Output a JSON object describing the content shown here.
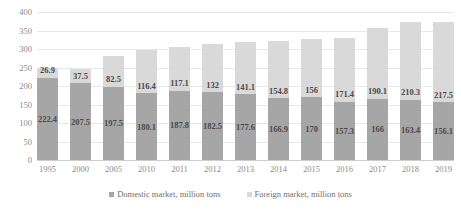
{
  "chart_data": {
    "type": "bar",
    "subtype": "stacked-column",
    "title": "",
    "xlabel": "",
    "ylabel": "",
    "ylim": [
      0,
      400
    ],
    "yticks": [
      0,
      50,
      100,
      150,
      200,
      250,
      300,
      350,
      400
    ],
    "grid": true,
    "legend_position": "bottom",
    "categories": [
      "1995",
      "2000",
      "2005",
      "2010",
      "2011",
      "2012",
      "2013",
      "2014",
      "2015",
      "2016",
      "2017",
      "2018",
      "2019"
    ],
    "series": [
      {
        "name": "Domestic market, million tons",
        "color": "#a6a6a6",
        "values": [
          222.4,
          207.5,
          197.5,
          180.1,
          187.8,
          182.5,
          177.6,
          166.9,
          170,
          157.3,
          166,
          163.4,
          156.1
        ],
        "labels": [
          "222.4",
          "207.5",
          "197.5",
          "180.1",
          "187.8",
          "182.5",
          "177.6",
          "166.9",
          "170",
          "157.3",
          "166",
          "163.4",
          "156.1"
        ]
      },
      {
        "name": "Foreign market, million tons",
        "color": "#d9d9d9",
        "values": [
          26.9,
          37.5,
          82.5,
          116.4,
          117.1,
          132,
          141.1,
          154.8,
          156,
          171.4,
          190.1,
          210.3,
          217.5
        ],
        "labels": [
          "26.9",
          "37.5",
          "82.5",
          "116.4",
          "117.1",
          "132",
          "141.1",
          "154.8",
          "156",
          "171.4",
          "190.1",
          "210.3",
          "217.5"
        ]
      }
    ],
    "ytick_labels": [
      "400",
      "350",
      "300",
      "250",
      "200",
      "150",
      "100",
      "50",
      "0"
    ]
  },
  "legend": {
    "items": [
      {
        "label": "Domestic market, million tons"
      },
      {
        "label": "Foreign market, million tons"
      }
    ]
  }
}
